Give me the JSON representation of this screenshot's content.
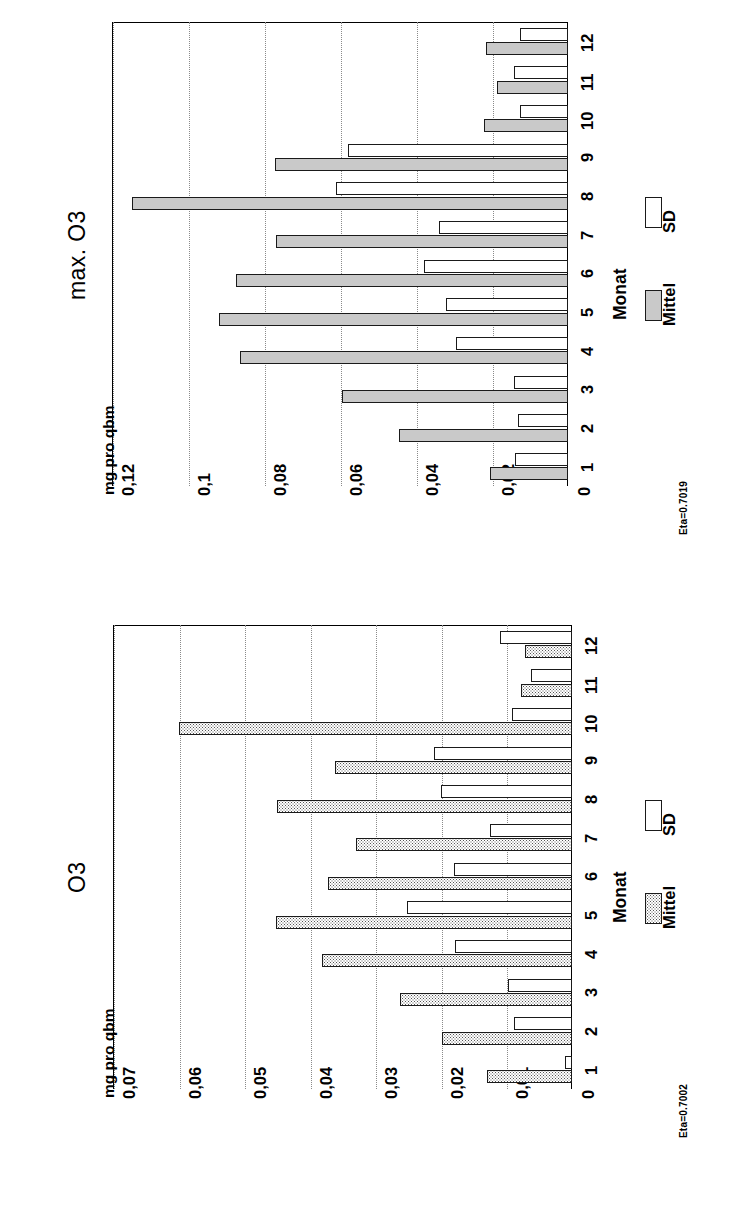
{
  "figure": {
    "eta_top": "Eta=0.7019",
    "eta_bottom": "Eta=0.7002"
  },
  "charts": [
    {
      "id": "max-o3",
      "title": "max. O3",
      "unit_label": "mg pro qbm",
      "category_axis_label": "Monat",
      "legend": [
        {
          "key": "mittel",
          "label": "Mittel",
          "swatch": "grey"
        },
        {
          "key": "sd",
          "label": "SD",
          "swatch": "white"
        }
      ],
      "ticks": [
        "0,12",
        "0,1",
        "0,08",
        "0,06",
        "0,04",
        "0,02",
        "0"
      ],
      "chart_data": {
        "type": "bar",
        "title": "max. O3",
        "xlabel": "Monat",
        "ylabel": "mg pro qbm",
        "ylim": [
          0,
          0.12
        ],
        "yticks": [
          0.12,
          0.1,
          0.08,
          0.06,
          0.04,
          0.02,
          0
        ],
        "grid": true,
        "legend_position": "right",
        "orientation": "vertical-bars-rotated",
        "categories": [
          "1",
          "2",
          "3",
          "4",
          "5",
          "6",
          "7",
          "8",
          "9",
          "10",
          "11",
          "12"
        ],
        "series": [
          {
            "name": "Mittel",
            "values": [
              0.0205,
              0.0446,
              0.0596,
              0.0862,
              0.0918,
              0.0875,
              0.0768,
              0.1148,
              0.0772,
              0.0222,
              0.0186,
              0.0215
            ]
          },
          {
            "name": "SD",
            "values": [
              0.014,
              0.0131,
              0.0143,
              0.0296,
              0.0321,
              0.038,
              0.034,
              0.061,
              0.058,
              0.0127,
              0.0143,
              0.0127
            ]
          }
        ]
      }
    },
    {
      "id": "o3",
      "title": "O3",
      "unit_label": "mg pro qbm",
      "category_axis_label": "Monat",
      "legend": [
        {
          "key": "mittel",
          "label": "Mittel",
          "swatch": "dot"
        },
        {
          "key": "sd",
          "label": "SD",
          "swatch": "white"
        }
      ],
      "ticks": [
        "0,07",
        "0,06",
        "0,05",
        "0,04",
        "0,03",
        "0,02",
        "0,01",
        "0"
      ],
      "chart_data": {
        "type": "bar",
        "title": "O3",
        "xlabel": "Monat",
        "ylabel": "mg pro qbm",
        "ylim": [
          0,
          0.07
        ],
        "yticks": [
          0.07,
          0.06,
          0.05,
          0.04,
          0.03,
          0.02,
          0.01,
          0
        ],
        "grid": true,
        "legend_position": "right",
        "orientation": "vertical-bars-rotated",
        "categories": [
          "1",
          "2",
          "3",
          "4",
          "5",
          "6",
          "7",
          "8",
          "9",
          "10",
          "11",
          "12"
        ],
        "series": [
          {
            "name": "Mittel",
            "values": [
              0.013,
              0.0198,
              0.0262,
              0.0382,
              0.0452,
              0.0372,
              0.033,
              0.045,
              0.0362,
              0.06,
              0.0078,
              0.0072
            ]
          },
          {
            "name": "SD",
            "values": [
              0.001,
              0.0088,
              0.0098,
              0.0178,
              0.0252,
              0.018,
              0.0125,
              0.02,
              0.021,
              0.0092,
              0.0062,
              0.011
            ]
          }
        ]
      }
    }
  ]
}
